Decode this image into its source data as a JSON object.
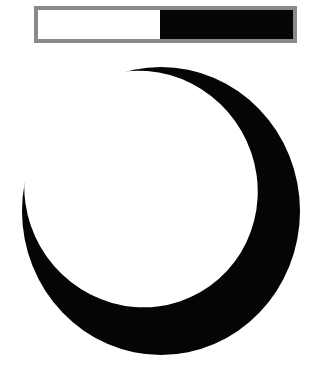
{
  "phase_bar": {
    "light_fraction": 0.48,
    "dark_fraction": 0.52,
    "border_color": "#8a8a8a",
    "light_color": "#ffffff",
    "dark_color": "#050505"
  },
  "moon": {
    "icon": "crescent-moon-icon",
    "outer_color": "#050505",
    "inner_color": "#ffffff"
  }
}
